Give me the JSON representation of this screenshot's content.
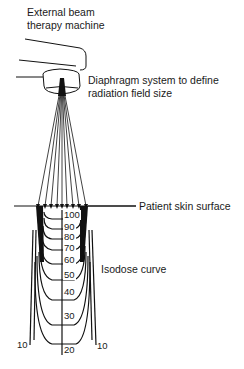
{
  "labels": {
    "machine_line1": "External beam",
    "machine_line2": "therapy machine",
    "diaphragm_line1": "Diaphragm system to define",
    "diaphragm_line2": "radiation field size",
    "skin": "Patient skin surface",
    "isodose": "Isodose curve"
  },
  "isodose_values": [
    "100",
    "90",
    "80",
    "70",
    "60",
    "50",
    "40",
    "30",
    "20",
    "10",
    "10"
  ],
  "colors": {
    "stroke": "#111111",
    "background": "#ffffff"
  }
}
